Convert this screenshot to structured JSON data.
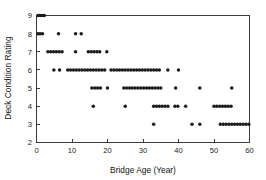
{
  "chart_data": {
    "type": "scatter",
    "title": "",
    "xlabel": "Bridge Age (Year)",
    "ylabel": "Deck Condition Rating",
    "xlim": [
      0,
      60
    ],
    "ylim": [
      2,
      9
    ],
    "xticks": [
      0,
      10,
      20,
      30,
      40,
      50,
      60
    ],
    "yticks": [
      2,
      3,
      4,
      5,
      6,
      7,
      8,
      9
    ],
    "xtick_labels": [
      "0",
      "10",
      "20",
      "30",
      "40",
      "50",
      "60"
    ],
    "ytick_labels": [
      "2",
      "3",
      "4",
      "5",
      "6",
      "7",
      "8",
      "9"
    ],
    "grid": false,
    "legend": null,
    "marker_color": "#1c1c1c",
    "marker_shape": "circle",
    "axis_color": "#3a3a3a",
    "background_color": "#ffffff",
    "points": [
      {
        "x": 0.4,
        "y": 9
      },
      {
        "x": 1.0,
        "y": 9
      },
      {
        "x": 1.6,
        "y": 9
      },
      {
        "x": 2.2,
        "y": 9
      },
      {
        "x": 0.4,
        "y": 8
      },
      {
        "x": 1.0,
        "y": 8
      },
      {
        "x": 1.7,
        "y": 8
      },
      {
        "x": 6.2,
        "y": 8
      },
      {
        "x": 11.0,
        "y": 8
      },
      {
        "x": 12.6,
        "y": 8
      },
      {
        "x": 3.2,
        "y": 7
      },
      {
        "x": 4.0,
        "y": 7
      },
      {
        "x": 4.8,
        "y": 7
      },
      {
        "x": 5.6,
        "y": 7
      },
      {
        "x": 6.4,
        "y": 7
      },
      {
        "x": 7.2,
        "y": 7
      },
      {
        "x": 11.0,
        "y": 7
      },
      {
        "x": 14.6,
        "y": 7
      },
      {
        "x": 15.4,
        "y": 7
      },
      {
        "x": 16.2,
        "y": 7
      },
      {
        "x": 17.0,
        "y": 7
      },
      {
        "x": 17.8,
        "y": 7
      },
      {
        "x": 19.8,
        "y": 7
      },
      {
        "x": 4.9,
        "y": 6
      },
      {
        "x": 6.5,
        "y": 6
      },
      {
        "x": 8.8,
        "y": 6
      },
      {
        "x": 9.6,
        "y": 6
      },
      {
        "x": 10.4,
        "y": 6
      },
      {
        "x": 11.2,
        "y": 6
      },
      {
        "x": 12.0,
        "y": 6
      },
      {
        "x": 12.8,
        "y": 6
      },
      {
        "x": 13.6,
        "y": 6
      },
      {
        "x": 14.4,
        "y": 6
      },
      {
        "x": 15.2,
        "y": 6
      },
      {
        "x": 16.0,
        "y": 6
      },
      {
        "x": 16.8,
        "y": 6
      },
      {
        "x": 17.6,
        "y": 6
      },
      {
        "x": 18.4,
        "y": 6
      },
      {
        "x": 19.2,
        "y": 6
      },
      {
        "x": 21.0,
        "y": 6
      },
      {
        "x": 21.8,
        "y": 6
      },
      {
        "x": 22.6,
        "y": 6
      },
      {
        "x": 23.4,
        "y": 6
      },
      {
        "x": 24.2,
        "y": 6
      },
      {
        "x": 25.0,
        "y": 6
      },
      {
        "x": 25.8,
        "y": 6
      },
      {
        "x": 26.6,
        "y": 6
      },
      {
        "x": 27.4,
        "y": 6
      },
      {
        "x": 28.2,
        "y": 6
      },
      {
        "x": 29.0,
        "y": 6
      },
      {
        "x": 29.8,
        "y": 6
      },
      {
        "x": 30.6,
        "y": 6
      },
      {
        "x": 31.4,
        "y": 6
      },
      {
        "x": 32.2,
        "y": 6
      },
      {
        "x": 33.0,
        "y": 6
      },
      {
        "x": 33.8,
        "y": 6
      },
      {
        "x": 34.6,
        "y": 6
      },
      {
        "x": 37.0,
        "y": 6
      },
      {
        "x": 40.0,
        "y": 6
      },
      {
        "x": 15.6,
        "y": 5
      },
      {
        "x": 16.4,
        "y": 5
      },
      {
        "x": 17.2,
        "y": 5
      },
      {
        "x": 18.0,
        "y": 5
      },
      {
        "x": 20.0,
        "y": 5
      },
      {
        "x": 24.6,
        "y": 5
      },
      {
        "x": 25.4,
        "y": 5
      },
      {
        "x": 26.2,
        "y": 5
      },
      {
        "x": 27.0,
        "y": 5
      },
      {
        "x": 27.8,
        "y": 5
      },
      {
        "x": 28.6,
        "y": 5
      },
      {
        "x": 29.4,
        "y": 5
      },
      {
        "x": 30.2,
        "y": 5
      },
      {
        "x": 31.0,
        "y": 5
      },
      {
        "x": 31.8,
        "y": 5
      },
      {
        "x": 32.6,
        "y": 5
      },
      {
        "x": 33.4,
        "y": 5
      },
      {
        "x": 34.2,
        "y": 5
      },
      {
        "x": 35.0,
        "y": 5
      },
      {
        "x": 39.2,
        "y": 5
      },
      {
        "x": 46.0,
        "y": 5
      },
      {
        "x": 55.0,
        "y": 5
      },
      {
        "x": 16.0,
        "y": 4
      },
      {
        "x": 25.0,
        "y": 4
      },
      {
        "x": 33.0,
        "y": 4
      },
      {
        "x": 33.8,
        "y": 4
      },
      {
        "x": 34.6,
        "y": 4
      },
      {
        "x": 35.4,
        "y": 4
      },
      {
        "x": 36.2,
        "y": 4
      },
      {
        "x": 37.0,
        "y": 4
      },
      {
        "x": 39.0,
        "y": 4
      },
      {
        "x": 39.8,
        "y": 4
      },
      {
        "x": 42.0,
        "y": 4
      },
      {
        "x": 50.0,
        "y": 4
      },
      {
        "x": 50.8,
        "y": 4
      },
      {
        "x": 51.6,
        "y": 4
      },
      {
        "x": 52.4,
        "y": 4
      },
      {
        "x": 53.2,
        "y": 4
      },
      {
        "x": 54.0,
        "y": 4
      },
      {
        "x": 54.8,
        "y": 4
      },
      {
        "x": 33.0,
        "y": 3
      },
      {
        "x": 43.8,
        "y": 3
      },
      {
        "x": 46.0,
        "y": 3
      },
      {
        "x": 51.8,
        "y": 3
      },
      {
        "x": 52.6,
        "y": 3
      },
      {
        "x": 53.4,
        "y": 3
      },
      {
        "x": 54.2,
        "y": 3
      },
      {
        "x": 55.0,
        "y": 3
      },
      {
        "x": 55.8,
        "y": 3
      },
      {
        "x": 56.6,
        "y": 3
      },
      {
        "x": 57.4,
        "y": 3
      },
      {
        "x": 58.2,
        "y": 3
      },
      {
        "x": 59.0,
        "y": 3
      },
      {
        "x": 59.8,
        "y": 3
      }
    ]
  }
}
